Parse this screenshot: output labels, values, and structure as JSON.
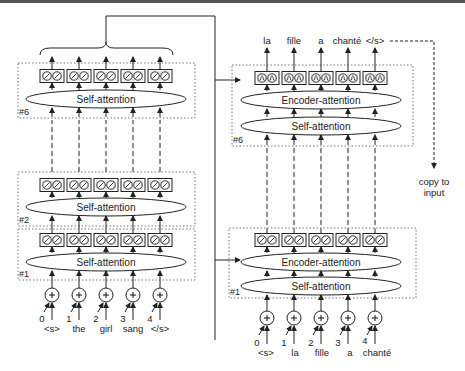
{
  "encoder": {
    "layers": [
      {
        "id": "#6",
        "attention_label": "Self-attention"
      },
      {
        "id": "#2",
        "attention_label": "Self-attention"
      },
      {
        "id": "#1",
        "attention_label": "Self-attention"
      }
    ],
    "positions": [
      "0",
      "1",
      "2",
      "3",
      "4"
    ],
    "tokens": [
      "<s>",
      "the",
      "girl",
      "sang",
      "</s>"
    ]
  },
  "decoder": {
    "layers": [
      {
        "id": "#6",
        "encoder_attention_label": "Encoder-attention",
        "self_attention_label": "Self-attention"
      },
      {
        "id": "#1",
        "encoder_attention_label": "Encoder-attention",
        "self_attention_label": "Self-attention"
      }
    ],
    "positions": [
      "0",
      "1",
      "2",
      "3",
      "4"
    ],
    "input_tokens": [
      "<s>",
      "la",
      "fille",
      "a",
      "chanté"
    ],
    "output_tokens": [
      "la",
      "fille",
      "a",
      "chanté",
      "</s>"
    ]
  },
  "copy_label_line1": "copy to",
  "copy_label_line2": "input",
  "colors": {
    "stroke": "#222222",
    "dotted_box": "#777777",
    "background": "#ffffff"
  }
}
